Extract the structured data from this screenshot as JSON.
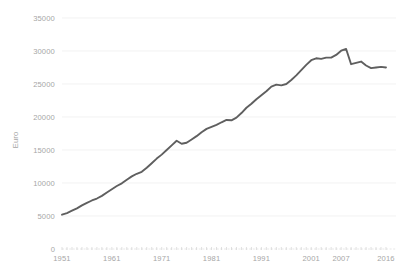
{
  "chart_data": {
    "type": "line",
    "title": "",
    "xlabel": "",
    "ylabel": "Euro",
    "ylim": [
      0,
      35000
    ],
    "xlim": [
      1951,
      2016
    ],
    "grid": true,
    "legend": "none",
    "y_ticks": [
      0,
      5000,
      10000,
      15000,
      20000,
      25000,
      30000,
      35000
    ],
    "y_tick_labels": [
      "0",
      "5000",
      "10000",
      "15000",
      "20000",
      "25000",
      "30000",
      "35000"
    ],
    "x_ticks": [
      1951,
      1961,
      1971,
      1981,
      1991,
      2001,
      2007,
      2016
    ],
    "x_tick_labels": [
      "1951",
      "1961",
      "1971",
      "1981",
      "1991",
      "2001",
      "2007",
      "2016"
    ],
    "series": [
      {
        "name": "Euro",
        "color": "#5f5f5f",
        "line_width": 1.9,
        "x": [
          1951,
          1952,
          1953,
          1954,
          1955,
          1956,
          1957,
          1958,
          1959,
          1960,
          1961,
          1962,
          1963,
          1964,
          1965,
          1966,
          1967,
          1968,
          1969,
          1970,
          1971,
          1972,
          1973,
          1974,
          1975,
          1976,
          1977,
          1978,
          1979,
          1980,
          1981,
          1982,
          1983,
          1984,
          1985,
          1986,
          1987,
          1988,
          1989,
          1990,
          1991,
          1992,
          1993,
          1994,
          1995,
          1996,
          1997,
          1998,
          1999,
          2000,
          2001,
          2002,
          2003,
          2004,
          2005,
          2006,
          2007,
          2008,
          2009,
          2010,
          2011,
          2012,
          2013,
          2014,
          2015,
          2016
        ],
        "values": [
          5200,
          5450,
          5800,
          6150,
          6600,
          7000,
          7350,
          7650,
          8050,
          8550,
          9050,
          9550,
          9950,
          10500,
          11000,
          11400,
          11700,
          12300,
          13000,
          13700,
          14300,
          15000,
          15700,
          16400,
          15950,
          16100,
          16600,
          17100,
          17700,
          18200,
          18500,
          18800,
          19200,
          19550,
          19500,
          19900,
          20600,
          21400,
          22000,
          22700,
          23300,
          23900,
          24600,
          24900,
          24800,
          25000,
          25600,
          26300,
          27100,
          27900,
          28600,
          28900,
          28800,
          29000,
          29000,
          29400,
          30050,
          30300,
          28000,
          28200,
          28400,
          27800,
          27400,
          27500,
          27600,
          27500
        ]
      }
    ]
  },
  "axis": {
    "y_axis_title": "Euro"
  }
}
